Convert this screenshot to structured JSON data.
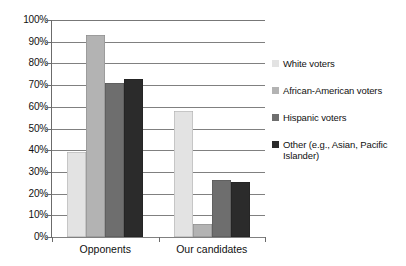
{
  "chart_data": {
    "type": "bar",
    "title": "",
    "subtitle": "",
    "xlabel": "",
    "ylabel": "",
    "categories": [
      "Opponents",
      "Our candidates"
    ],
    "series": [
      {
        "name": "White voters",
        "color": "#e3e3e3",
        "values": [
          39,
          58
        ]
      },
      {
        "name": "African-American voters",
        "color": "#b3b3b3",
        "values": [
          93,
          6
        ]
      },
      {
        "name": "Hispanic voters",
        "color": "#6e6e6e",
        "values": [
          71,
          26.5
        ]
      },
      {
        "name": "Other (e.g., Asian, Pacific Islander)",
        "color": "#2b2b2b",
        "values": [
          73,
          25.5
        ]
      }
    ],
    "ylim": [
      0,
      100
    ],
    "ytick_values": [
      0,
      10,
      20,
      30,
      40,
      50,
      60,
      70,
      80,
      90,
      100
    ],
    "ytick_labels": [
      "0%",
      "10%",
      "20%",
      "30%",
      "40%",
      "50%",
      "60%",
      "70%",
      "80%",
      "90%",
      "100%"
    ],
    "grid": true,
    "grid_axis": "y",
    "legend_position": "right",
    "value_format": "percent",
    "annotations": []
  },
  "legend": {
    "items": [
      {
        "label": "White voters",
        "color": "#e3e3e3"
      },
      {
        "label": "African-American voters",
        "color": "#b3b3b3"
      },
      {
        "label": "Hispanic voters",
        "color": "#6e6e6e"
      },
      {
        "label": "Other (e.g., Asian, Pacific Islander)",
        "color": "#2b2b2b"
      }
    ]
  },
  "axes": {
    "y_labels": [
      "100%",
      "90%",
      "80%",
      "70%",
      "60%",
      "50%",
      "40%",
      "30%",
      "20%",
      "10%",
      "0%"
    ],
    "x_labels": [
      "Opponents",
      "Our candidates"
    ]
  }
}
